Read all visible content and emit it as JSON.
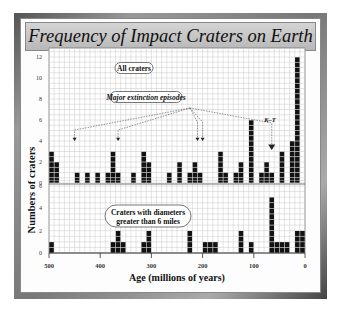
{
  "title": "Frequency of Impact Craters on Earth",
  "ylabel": "Numbers of craters",
  "xlabel": "Age (millions of years)",
  "annotations": {
    "all_craters": "All craters",
    "major_extinction": "Major extinction episodes",
    "kt": "K–T",
    "large_craters_line1": "Craters with diameters",
    "large_craters_line2": "greater than 6 miles"
  },
  "chart_data": [
    {
      "type": "bar",
      "title": "All craters",
      "xlabel": "Age (millions of years)",
      "ylabel": "Numbers of craters",
      "bin_width_myr": 10,
      "x_ticks": [
        500,
        400,
        300,
        200,
        100,
        0
      ],
      "y_ticks": [
        0,
        2,
        4,
        6,
        8,
        10,
        12
      ],
      "ylim": [
        0,
        12
      ],
      "xlim": [
        500,
        0
      ],
      "grid": true,
      "categories": [
        495,
        485,
        475,
        465,
        455,
        445,
        435,
        425,
        415,
        405,
        395,
        385,
        375,
        365,
        355,
        345,
        335,
        325,
        315,
        305,
        295,
        285,
        275,
        265,
        255,
        245,
        235,
        225,
        215,
        205,
        195,
        185,
        175,
        165,
        155,
        145,
        135,
        125,
        115,
        105,
        95,
        85,
        75,
        65,
        55,
        45,
        35,
        25,
        15,
        5
      ],
      "values": [
        3,
        2,
        0,
        0,
        0,
        1,
        0,
        1,
        0,
        1,
        0,
        1,
        3,
        1,
        0,
        0,
        1,
        0,
        3,
        2,
        0,
        0,
        0,
        1,
        0,
        2,
        0,
        1,
        2,
        1,
        0,
        0,
        0,
        3,
        1,
        0,
        1,
        2,
        0,
        6,
        0,
        1,
        2,
        1,
        0,
        3,
        0,
        4,
        12,
        0
      ],
      "extinction_markers_myr": [
        450,
        365,
        210,
        200,
        65
      ],
      "annotations": [
        "All craters",
        "Major extinction episodes",
        "K–T"
      ]
    },
    {
      "type": "bar",
      "title": "Craters with diameters greater than 6 miles",
      "xlabel": "Age (millions of years)",
      "ylabel": "Numbers of craters",
      "bin_width_myr": 10,
      "x_ticks": [
        500,
        400,
        300,
        200,
        100,
        0
      ],
      "y_ticks": [
        0,
        2,
        4,
        6
      ],
      "ylim": [
        0,
        6
      ],
      "xlim": [
        500,
        0
      ],
      "grid": true,
      "categories": [
        495,
        485,
        475,
        465,
        455,
        445,
        435,
        425,
        415,
        405,
        395,
        385,
        375,
        365,
        355,
        345,
        335,
        325,
        315,
        305,
        295,
        285,
        275,
        265,
        255,
        245,
        235,
        225,
        215,
        205,
        195,
        185,
        175,
        165,
        155,
        145,
        135,
        125,
        115,
        105,
        95,
        85,
        75,
        65,
        55,
        45,
        35,
        25,
        15,
        5
      ],
      "values": [
        1,
        0,
        0,
        0,
        0,
        0,
        0,
        0,
        0,
        0,
        0,
        0,
        1,
        2,
        1,
        0,
        0,
        0,
        1,
        2,
        0,
        0,
        0,
        0,
        0,
        0,
        0,
        2,
        0,
        0,
        1,
        1,
        1,
        0,
        0,
        0,
        0,
        2,
        0,
        1,
        0,
        0,
        0,
        5,
        1,
        1,
        1,
        0,
        2,
        2
      ],
      "annotations": [
        "Craters with diameters greater than 6 miles"
      ]
    }
  ]
}
